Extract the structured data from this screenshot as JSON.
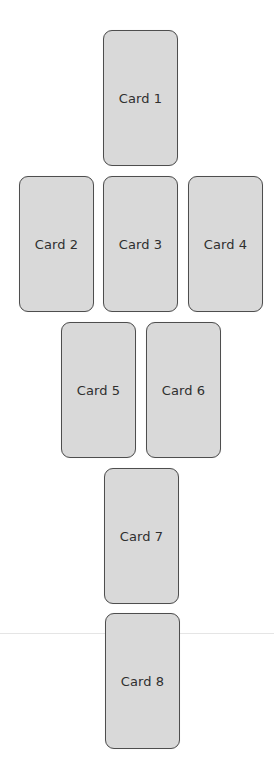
{
  "layout": {
    "title": "Eight card spread",
    "rows": [
      [
        "Card 1"
      ],
      [
        "Card 2",
        "Card 3",
        "Card 4"
      ],
      [
        "Card 5",
        "Card 6"
      ],
      [
        "Card 7"
      ],
      [
        "Card 8"
      ]
    ]
  },
  "cards": [
    {
      "label": "Card 1"
    },
    {
      "label": "Card 2"
    },
    {
      "label": "Card 3"
    },
    {
      "label": "Card 4"
    },
    {
      "label": "Card 5"
    },
    {
      "label": "Card 6"
    },
    {
      "label": "Card 7"
    },
    {
      "label": "Card 8"
    }
  ],
  "colors": {
    "card_fill": "#d9d9d9",
    "card_border": "#4e4e4e",
    "text": "#2f2f2f",
    "background": "#ffffff"
  }
}
